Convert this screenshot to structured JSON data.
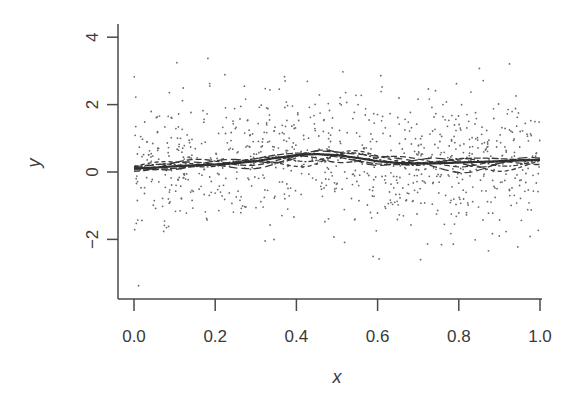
{
  "chart_data": {
    "type": "scatter",
    "title": "",
    "xlabel": "x",
    "ylabel": "y",
    "xlim": [
      -0.04,
      1.02
    ],
    "ylim": [
      -3.8,
      4.4
    ],
    "x_ticks": [
      0.0,
      0.2,
      0.4,
      0.6,
      0.8,
      1.0
    ],
    "x_tick_labels": [
      "0.0",
      "0.2",
      "0.4",
      "0.6",
      "0.8",
      "1.0"
    ],
    "y_ticks": [
      -2,
      0,
      2,
      4
    ],
    "y_tick_labels": [
      "-2",
      "0",
      "2",
      "4"
    ],
    "grid": false,
    "legend": null,
    "series": [
      {
        "name": "observations",
        "style": "points",
        "data_source": "synthetic",
        "note": "Not read from the image. Generated by a seeded RNG to mimic the visible scatter: about 900 points over x in [0, 1], y roughly in [-3.5, 4.1], centred on the true curve.",
        "n": 900,
        "seed": 12345,
        "noise_sd": 1.0
      },
      {
        "name": "true function",
        "style": "solid",
        "x": [
          0.0,
          0.05,
          0.1,
          0.15,
          0.2,
          0.25,
          0.3,
          0.35,
          0.4,
          0.45,
          0.5,
          0.55,
          0.6,
          0.65,
          0.7,
          0.75,
          0.8,
          0.85,
          0.9,
          0.95,
          1.0
        ],
        "y": [
          0.1,
          0.13,
          0.17,
          0.2,
          0.22,
          0.26,
          0.32,
          0.42,
          0.5,
          0.53,
          0.5,
          0.42,
          0.32,
          0.27,
          0.25,
          0.26,
          0.28,
          0.3,
          0.32,
          0.34,
          0.36
        ]
      },
      {
        "name": "fitted estimates",
        "style": "dashed",
        "count": 6,
        "description": "Several dashed curves oscillating around the true function, wider spread near x≈0.4–0.5 and x≈0.85; amplitude roughly ±0.6."
      }
    ]
  },
  "colors": {
    "axis": "#4a4a4a",
    "points": "#6a6a6a",
    "line": "#2f2f2f"
  }
}
